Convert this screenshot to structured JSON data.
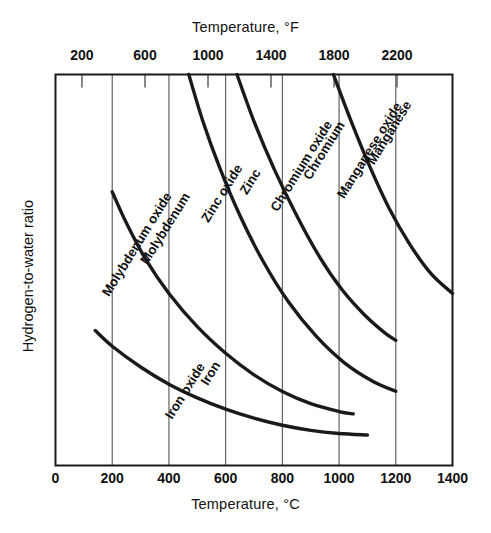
{
  "chart_data": {
    "type": "line",
    "title": "",
    "xlabel": "Temperature, °C",
    "xlabel_top": "Temperature, °F",
    "ylabel": "Hydrogen-to-water ratio",
    "xlim": [
      0,
      1400
    ],
    "ylim": [
      0,
      1
    ],
    "grid": true,
    "legend_position": "inline-curve-labels",
    "axes": {
      "bottom": {
        "unit": "°C",
        "label": "Temperature, °C",
        "ticks": [
          0,
          200,
          400,
          600,
          800,
          1000,
          1200,
          1400
        ],
        "tick_labels": [
          "0",
          "200",
          "400",
          "600",
          "800",
          "1000",
          "1200",
          "1400"
        ]
      },
      "top": {
        "unit": "°F",
        "label": "Temperature, °F",
        "ticks_f": [
          200,
          600,
          1000,
          1400,
          1800,
          2200
        ],
        "tick_labels": [
          "200",
          "600",
          "1000",
          "1400",
          "1800",
          "2200"
        ],
        "ticks_in_celsius": [
          93.3,
          315.6,
          537.8,
          760.0,
          982.2,
          1204.4
        ]
      },
      "left": {
        "label": "Hydrogen-to-water ratio",
        "ticks": [],
        "tick_labels": []
      }
    },
    "series": [
      {
        "name": "Iron / Iron oxide",
        "label_primary": "Iron",
        "label_secondary": "Iron oxide",
        "points": [
          [
            140,
            0.345
          ],
          [
            200,
            0.305
          ],
          [
            300,
            0.252
          ],
          [
            400,
            0.208
          ],
          [
            500,
            0.173
          ],
          [
            600,
            0.144
          ],
          [
            700,
            0.121
          ],
          [
            800,
            0.103
          ],
          [
            900,
            0.09
          ],
          [
            1000,
            0.082
          ],
          [
            1100,
            0.078
          ]
        ]
      },
      {
        "name": "Molybdenum / Molybdenum oxide",
        "label_primary": "Molybdenum",
        "label_secondary": "Molybdenum oxide",
        "points": [
          [
            200,
            0.7
          ],
          [
            250,
            0.62
          ],
          [
            320,
            0.525
          ],
          [
            400,
            0.44
          ],
          [
            500,
            0.355
          ],
          [
            600,
            0.287
          ],
          [
            700,
            0.232
          ],
          [
            800,
            0.189
          ],
          [
            900,
            0.158
          ],
          [
            1000,
            0.138
          ],
          [
            1050,
            0.132
          ]
        ]
      },
      {
        "name": "Zinc / Zinc oxide",
        "label_primary": "Zinc",
        "label_secondary": "Zinc oxide",
        "points": [
          [
            470,
            1.0
          ],
          [
            520,
            0.88
          ],
          [
            580,
            0.76
          ],
          [
            650,
            0.64
          ],
          [
            730,
            0.525
          ],
          [
            820,
            0.42
          ],
          [
            920,
            0.33
          ],
          [
            1020,
            0.262
          ],
          [
            1120,
            0.215
          ],
          [
            1200,
            0.19
          ]
        ]
      },
      {
        "name": "Chromium / Chromium oxide",
        "label_primary": "Chromium",
        "label_secondary": "Chromium oxide",
        "points": [
          [
            640,
            1.0
          ],
          [
            700,
            0.88
          ],
          [
            770,
            0.76
          ],
          [
            850,
            0.64
          ],
          [
            930,
            0.535
          ],
          [
            1010,
            0.45
          ],
          [
            1090,
            0.385
          ],
          [
            1160,
            0.34
          ],
          [
            1200,
            0.32
          ]
        ]
      },
      {
        "name": "Manganese / Manganese oxide",
        "label_primary": "Manganese",
        "label_secondary": "Manganese oxide",
        "points": [
          [
            980,
            1.0
          ],
          [
            1040,
            0.885
          ],
          [
            1105,
            0.77
          ],
          [
            1175,
            0.66
          ],
          [
            1250,
            0.565
          ],
          [
            1325,
            0.49
          ],
          [
            1400,
            0.44
          ]
        ]
      }
    ],
    "curve_labels": [
      {
        "text": "Manganese",
        "x": 1190,
        "y": 0.845
      },
      {
        "text": "Manganese oxide",
        "x": 1120,
        "y": 0.8
      },
      {
        "text": "Chromium",
        "x": 960,
        "y": 0.8
      },
      {
        "text": "Chromium oxide",
        "x": 880,
        "y": 0.76
      },
      {
        "text": "Zinc",
        "x": 700,
        "y": 0.72
      },
      {
        "text": "Zinc oxide",
        "x": 600,
        "y": 0.69
      },
      {
        "text": "Molybdenum",
        "x": 400,
        "y": 0.6
      },
      {
        "text": "Molybdenum oxide",
        "x": 300,
        "y": 0.56
      },
      {
        "text": "Iron",
        "x": 560,
        "y": 0.23
      },
      {
        "text": "Iron oxide",
        "x": 470,
        "y": 0.185
      }
    ],
    "colors": {
      "curve": "#1a1a1a",
      "frame": "#1a1a1a",
      "grid": "#555555",
      "text": "#111111",
      "background": "#ffffff"
    }
  }
}
